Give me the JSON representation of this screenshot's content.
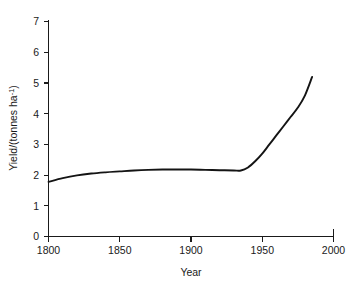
{
  "chart_data": {
    "type": "line",
    "title": "",
    "subtitle": "",
    "xlabel": "Year",
    "ylabel": "Yield/(tonnes ha⁻¹)",
    "ylabel_main": "Yield/(tonnes ha",
    "ylabel_sup": "-1",
    "ylabel_tail": ")",
    "xlim": [
      1800,
      2000
    ],
    "ylim": [
      0,
      7.4
    ],
    "grid": false,
    "legend": null,
    "legend_position": "none",
    "xticks": [
      1800,
      1850,
      1900,
      1950,
      2000
    ],
    "xtick_labels": [
      "1800",
      "1850",
      "1900",
      "1950",
      "2000"
    ],
    "yticks": [
      0,
      1,
      2,
      3,
      4,
      5,
      6,
      7
    ],
    "ytick_labels": [
      "0",
      "1",
      "2",
      "3",
      "4",
      "5",
      "6",
      "7"
    ],
    "series": [
      {
        "name": "Wheat yield",
        "color": "#141414",
        "x": [
          1800,
          1810,
          1820,
          1830,
          1840,
          1850,
          1860,
          1870,
          1880,
          1890,
          1900,
          1910,
          1920,
          1930,
          1935,
          1940,
          1945,
          1950,
          1955,
          1960,
          1965,
          1970,
          1975,
          1980,
          1985
        ],
        "y": [
          1.78,
          1.9,
          1.99,
          2.05,
          2.09,
          2.12,
          2.15,
          2.17,
          2.18,
          2.18,
          2.18,
          2.17,
          2.16,
          2.15,
          2.15,
          2.25,
          2.45,
          2.7,
          3.0,
          3.3,
          3.6,
          3.9,
          4.2,
          4.6,
          5.2
        ]
      }
    ],
    "annotations": []
  },
  "axis": {
    "x_tick_count": "5",
    "y_tick_count": "8"
  }
}
